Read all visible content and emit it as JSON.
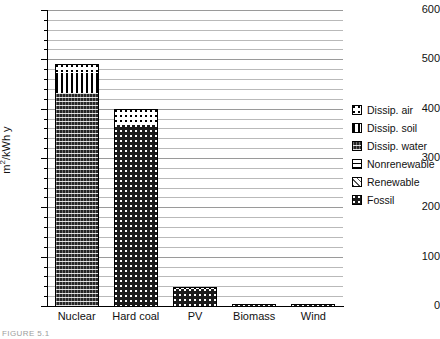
{
  "chart_data": {
    "type": "bar",
    "title": "",
    "xlabel": "",
    "ylabel": "m²/kWh y",
    "ylim": [
      0,
      600
    ],
    "ytick_values": [
      0,
      100,
      200,
      300,
      400,
      500,
      600
    ],
    "ytick_labels": [
      "0",
      "100",
      "200",
      "300",
      "400",
      "500",
      "600"
    ],
    "minor_gridline_step": 20,
    "grid": true,
    "stacked": true,
    "legend_position": "right",
    "categories": [
      "Nuclear",
      "Hard coal",
      "PV",
      "Biomass",
      "Wind"
    ],
    "series": [
      {
        "name": "Dissip. air",
        "pattern": "dotted-sparse",
        "values": [
          18,
          33,
          3,
          1,
          0.5
        ]
      },
      {
        "name": "Dissip. soil",
        "pattern": "vertical-lines",
        "values": [
          40,
          0,
          0,
          0,
          0
        ]
      },
      {
        "name": "Dissip. water",
        "pattern": "wavy-dark",
        "values": [
          432,
          0,
          0,
          0,
          0
        ]
      },
      {
        "name": "Nonrenewable",
        "pattern": "horizontal-lines",
        "values": [
          0,
          0,
          0,
          0,
          0
        ]
      },
      {
        "name": "Renewable",
        "pattern": "diagonal-lines",
        "values": [
          0,
          0,
          0,
          0,
          0
        ]
      },
      {
        "name": "Fossil",
        "pattern": "dotted-dark",
        "values": [
          0,
          367,
          35,
          2,
          2.5
        ]
      }
    ],
    "totals": [
      490,
      400,
      38,
      3,
      3
    ]
  },
  "legend": {
    "items": [
      {
        "label": "Dissip. air",
        "pattern": "dotted-sparse"
      },
      {
        "label": "Dissip. soil",
        "pattern": "vertical-lines"
      },
      {
        "label": "Dissip. water",
        "pattern": "wavy-dark"
      },
      {
        "label": "Nonrenewable",
        "pattern": "horizontal-lines"
      },
      {
        "label": "Renewable",
        "pattern": "diagonal-lines"
      },
      {
        "label": "Fossil",
        "pattern": "dotted-dark"
      }
    ]
  },
  "caption": "FIGURE 5.1"
}
